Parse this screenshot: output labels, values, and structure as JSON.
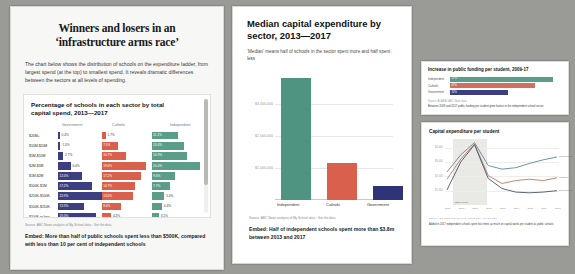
{
  "left_panel": {
    "headline_line1": "Winners and losers in an",
    "headline_line2": "‘infrastructure arms race’",
    "standfirst": "The chart below shows the distribution of schools on the expenditure ladder, from largest spend (at the top) to smallest spend. It reveals dramatic differences between the sectors at all levels of spending.",
    "chart_title": "Percentage of schools in each sector by total capital spend, 2013—2017",
    "source": "Source: ABC News analysis of My School data · Get the data",
    "embed_note": "Embed: More than half of public schools spent less than $500K, compared with less than 10 per cent of independent schools"
  },
  "mid_panel": {
    "title": "Median capital expenditure by sector, 2013—2017",
    "subtitle": "‘Median’ means half of schools in the sector spent more and half spent less",
    "source": "Source: ABC News analysis of My School data · Get the data",
    "embed_note": "Embed: Half of independent schools spent more than $3.8m between 2013 and 2017"
  },
  "right_top_panel": {
    "title": "Increase in public funding per student, 2009-17",
    "source": "Source: ACARA / ABC News data",
    "note": "Between 2009 and 2017 public funding per student grew fastest in the independent school sector"
  },
  "right_bottom_panel": {
    "title": "Capital expenditure per student",
    "ber_label": "BER period",
    "source": "Source: ABC News analysis of My School data · Get the data",
    "note": "Added in 2017 independent schools spent four times as much on capital works per student as public schools"
  },
  "chart_data": [
    {
      "type": "bar",
      "orientation": "horizontal-grouped",
      "title": "Percentage of schools in each sector by total capital spend, 2013—2017",
      "xlabel": "",
      "ylabel": "Total capital spend band",
      "columns": [
        "Government",
        "Catholic",
        "Independent"
      ],
      "categories": [
        "$20M+",
        "$10M-$20M",
        "$5M-$10M",
        "$2M-$5M",
        "$1M-$2M",
        "$500K-$1M",
        "$250K-$500K",
        "$100K-$250K",
        "$100K or less"
      ],
      "series": [
        {
          "name": "Government",
          "color": "#3b3f82",
          "values": [
            0.4,
            1.3,
            2.7,
            6.4,
            12.0,
            17.2,
            22.9,
            13.3,
            19.3
          ]
        },
        {
          "name": "Catholic",
          "color": "#d9604c",
          "values": [
            1.7,
            7.3,
            10.7,
            19.6,
            17.2,
            14.7,
            13.6,
            8.4,
            4.2
          ]
        },
        {
          "name": "Independent",
          "color": "#5a9e8a",
          "values": [
            11.1,
            13.4,
            14.9,
            20.4,
            9.6,
            7.7,
            5.4,
            4.4,
            3.1
          ]
        }
      ]
    },
    {
      "type": "bar",
      "orientation": "vertical",
      "title": "Median capital expenditure by sector, 2013—2017",
      "categories": [
        "Independent",
        "Catholic",
        "Government"
      ],
      "values": [
        3800000,
        1150000,
        430000
      ],
      "colors": [
        "#4e9480",
        "#d9604c",
        "#2f3478"
      ],
      "ylim": [
        0,
        4000000
      ],
      "yticks": [
        1000000,
        2000000,
        3000000
      ],
      "ytick_labels": [
        "$1,000,000",
        "$2,000,000",
        "$3,000,000"
      ],
      "xlabel": "",
      "ylabel": ""
    },
    {
      "type": "bar",
      "orientation": "horizontal",
      "title": "Increase in public funding per student, 2009-17",
      "categories": [
        "Independent",
        "Catholic",
        "Government"
      ],
      "values": [
        57,
        47,
        32
      ],
      "value_labels": [
        "57%",
        "47%",
        "32%"
      ],
      "colors": [
        "#5a9e8a",
        "#d0705f",
        "#3b3f82"
      ]
    },
    {
      "type": "line",
      "title": "Capital expenditure per student",
      "x": [
        "2009",
        "2010",
        "2011",
        "2012",
        "2013",
        "2014",
        "2015",
        "2016",
        "2017"
      ],
      "xlabel": "",
      "ylabel": "",
      "yticks": [
        1000,
        2000,
        3000,
        4000
      ],
      "ytick_labels": [
        "$1,000",
        "$2,000",
        "$3,000",
        "$4,000"
      ],
      "shaded_region": {
        "label": "BER period",
        "from": "2009",
        "to": "2011"
      },
      "series": [
        {
          "name": "Independent",
          "color": "#5a8a9e",
          "values": [
            2300,
            3500,
            4350,
            2750,
            2500,
            2600,
            2900,
            3150,
            3350
          ]
        },
        {
          "name": "Catholic",
          "color": "#c07a62",
          "values": [
            1800,
            3200,
            4250,
            2050,
            1500,
            1700,
            1800,
            1700,
            1900
          ]
        },
        {
          "name": "Government",
          "color": "#4a5566",
          "values": [
            1050,
            3000,
            4200,
            1850,
            1150,
            900,
            850,
            900,
            1000
          ]
        }
      ]
    }
  ]
}
